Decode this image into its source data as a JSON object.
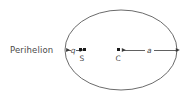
{
  "figure": {
    "type": "orbit-ellipse-diagram",
    "background_color": "#ffffff",
    "stroke_color": "#5a5a5a",
    "text_color": "#4a4a4a",
    "marker_color": "#1a1a1a"
  },
  "labels": {
    "perihelion": "Perihelion",
    "perihelion_distance": "q",
    "semi_major_axis": "a",
    "sun_point": "S",
    "center_point": "C"
  },
  "geometry": {
    "ellipse_center_x": 121,
    "ellipse_center_y": 50,
    "ellipse_radius_x": 56,
    "ellipse_radius_y": 40,
    "left_vertex_x": 65,
    "right_vertex_x": 177,
    "sun_focus_x": 81,
    "center_marker_x": 118,
    "axis_y": 50
  },
  "measurements": {
    "q_arrow_from_x": 66,
    "q_arrow_to_x": 80,
    "q_label_x": 73,
    "a_arrow_from_x": 121,
    "a_arrow_to_x": 176,
    "a_label_x": 149
  }
}
